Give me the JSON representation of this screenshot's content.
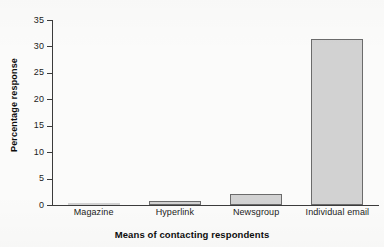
{
  "chart_data": {
    "type": "bar",
    "title": "",
    "subtitle": "",
    "xlabel": "Means of contacting respondents",
    "ylabel": "Percentage response",
    "categories": [
      "Magazine",
      "Hyperlink",
      "Newsgroup",
      "Individual email"
    ],
    "values": [
      0.2,
      0.8,
      2.0,
      31.4
    ],
    "ylim": [
      0,
      35
    ],
    "yticks": [
      0,
      5,
      10,
      15,
      20,
      25,
      30,
      35
    ],
    "ytick_labels": [
      "0",
      "5",
      "10",
      "15",
      "20",
      "25",
      "30",
      "35"
    ],
    "grid": false,
    "legend": false,
    "legend_position": "none",
    "bar_fill_color": "#d2d2d2",
    "bar_edge_color": "#6b6b6b",
    "axis_color": "#3b3b3b",
    "background_color": "#fbfbfa",
    "series": [
      {
        "name": "Percentage response",
        "values": [
          0.2,
          0.8,
          2.0,
          31.4
        ]
      }
    ]
  },
  "chart": {
    "y_axis_title": "Percentage response",
    "x_axis_title": "Means of contacting respondents",
    "y_ticks": [
      {
        "label": "35",
        "value": 35
      },
      {
        "label": "30",
        "value": 30
      },
      {
        "label": "25",
        "value": 25
      },
      {
        "label": "20",
        "value": 20
      },
      {
        "label": "15",
        "value": 15
      },
      {
        "label": "10",
        "value": 10
      },
      {
        "label": "5",
        "value": 5
      },
      {
        "label": "0",
        "value": 0
      }
    ],
    "bars": [
      {
        "label": "Magazine",
        "value": 0.2
      },
      {
        "label": "Hyperlink",
        "value": 0.8
      },
      {
        "label": "Newsgroup",
        "value": 2.0
      },
      {
        "label": "Individual email",
        "value": 31.4
      }
    ]
  }
}
